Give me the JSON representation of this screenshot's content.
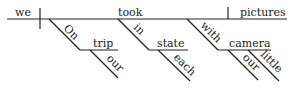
{
  "diagram": {
    "type": "sentence-diagram",
    "words": {
      "subject": "we",
      "verb": "took",
      "object": "pictures",
      "prep1": "On",
      "prep1_object": "trip",
      "prep1_object_modifier": "our",
      "prep2": "in",
      "prep2_object": "state",
      "prep2_object_modifier": "each",
      "prep3": "with",
      "prep3_object": "camera",
      "prep3_object_modifier1": "our",
      "prep3_object_modifier2": "little"
    }
  }
}
